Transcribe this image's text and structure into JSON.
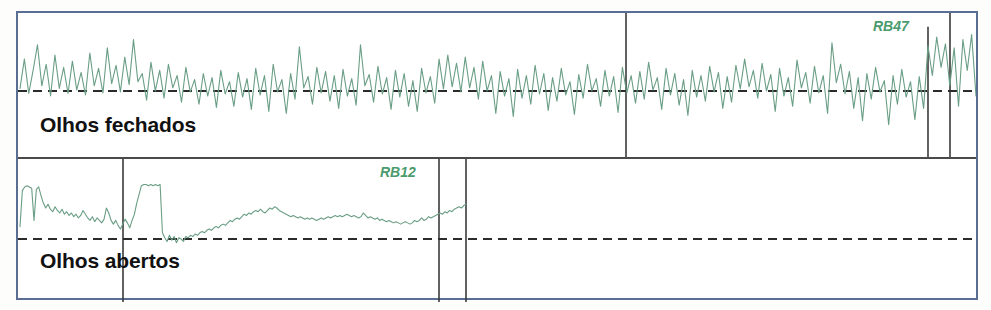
{
  "figure": {
    "kind": "eeg-recording-panels",
    "background_color": "#ffffff",
    "frame_color": "#5a6e94",
    "divider_color": "#4a4a4a",
    "baseline_color": "#2b2b2b",
    "trace_color": "#6a9e85",
    "tag_color": "#4b9b6e",
    "label_color": "#111111"
  },
  "panels": [
    {
      "id": "closed",
      "label": "Olhos fechados",
      "tag": "RB47",
      "baseline_label": "",
      "markers": [
        608,
        910,
        932
      ]
    },
    {
      "id": "open",
      "label": "Olhos abertos",
      "tag": "RB12",
      "baseline_label": "",
      "markers": [
        105,
        421,
        448
      ]
    }
  ],
  "chart_data": [
    {
      "type": "line",
      "id": "closed",
      "title": "Olhos fechados",
      "series_name": "RB47",
      "xlabel": "",
      "ylabel": "",
      "grid": false,
      "legend": "inline-tag-top-right",
      "baseline": 0,
      "xlim": [
        0,
        958
      ],
      "ylim": [
        -1.15,
        1.15
      ],
      "annotations": [
        "RB47"
      ],
      "vertical_markers": [
        608,
        910,
        932
      ],
      "values": [
        0.05,
        0.62,
        -0.05,
        0.4,
        0.9,
        0.1,
        0.52,
        -0.1,
        0.7,
        0.05,
        0.46,
        -0.05,
        0.58,
        0.02,
        0.36,
        -0.08,
        0.74,
        0.1,
        0.44,
        -0.04,
        0.84,
        0.14,
        0.5,
        -0.02,
        0.66,
        0.12,
        1.0,
        0.18,
        0.34,
        -0.18,
        0.56,
        0.0,
        0.4,
        -0.14,
        0.52,
        0.06,
        0.3,
        -0.22,
        0.46,
        -0.02,
        0.22,
        -0.26,
        0.34,
        -0.1,
        0.26,
        -0.32,
        0.4,
        -0.06,
        0.18,
        -0.3,
        0.36,
        -0.12,
        0.24,
        -0.36,
        0.44,
        -0.08,
        0.3,
        -0.4,
        0.52,
        -0.02,
        0.22,
        -0.44,
        0.34,
        -0.16,
        0.86,
        0.06,
        0.28,
        -0.26,
        0.46,
        -0.04,
        0.38,
        -0.2,
        0.3,
        -0.34,
        0.42,
        -0.1,
        0.24,
        -0.28,
        0.9,
        0.1,
        0.32,
        -0.22,
        0.48,
        -0.06,
        0.26,
        -0.36,
        0.4,
        -0.12,
        0.34,
        -0.3,
        0.2,
        -0.4,
        0.44,
        -0.04,
        0.28,
        -0.24,
        0.62,
        0.04,
        0.7,
        0.08,
        0.54,
        -0.02,
        0.66,
        0.06,
        0.46,
        -0.16,
        0.58,
        0.0,
        0.3,
        -0.44,
        0.38,
        -0.1,
        0.24,
        -0.5,
        0.42,
        -0.14,
        0.3,
        -0.26,
        0.5,
        -0.06,
        0.34,
        -0.38,
        0.26,
        -0.2,
        0.44,
        -0.08,
        0.18,
        -0.46,
        0.32,
        -0.14,
        0.52,
        0.0,
        0.24,
        -0.3,
        0.4,
        -0.1,
        0.28,
        -0.42,
        0.46,
        -0.04,
        0.3,
        -0.24,
        0.38,
        -0.16,
        0.56,
        0.02,
        0.26,
        -0.36,
        0.44,
        -0.08,
        0.34,
        -0.28,
        0.22,
        -0.48,
        0.4,
        -0.12,
        0.3,
        -0.2,
        0.48,
        -0.02,
        0.36,
        -0.34,
        0.28,
        -0.22,
        0.5,
        0.04,
        0.62,
        0.08,
        0.4,
        -0.14,
        0.54,
        0.0,
        0.32,
        -0.4,
        0.44,
        -0.1,
        0.26,
        -0.3,
        0.6,
        0.06,
        0.36,
        -0.24,
        0.48,
        -0.04,
        0.3,
        -0.44,
        0.94,
        0.16,
        0.52,
        -0.06,
        0.38,
        -0.34,
        0.26,
        -0.58,
        0.34,
        -0.16,
        0.46,
        -0.02,
        0.2,
        -0.66,
        0.3,
        -0.26,
        0.42,
        -0.12,
        0.18,
        -0.56,
        0.28,
        -0.34,
        0.88,
        0.3,
        1.05,
        0.46,
        0.92,
        0.1,
        0.84,
        -0.3,
        1.0,
        0.4,
        1.1,
        -0.1
      ]
    },
    {
      "type": "line",
      "id": "open",
      "title": "Olhos abertos",
      "series_name": "RB12",
      "xlabel": "",
      "ylabel": "",
      "grid": false,
      "legend": "inline-tag-top-right",
      "baseline": 0,
      "xlim": [
        0,
        958
      ],
      "ylim": [
        -0.35,
        1.15
      ],
      "annotations": [
        "RB12"
      ],
      "vertical_markers": [
        105,
        421,
        448
      ],
      "data_extent_x": [
        2,
        448
      ],
      "values": [
        0.2,
        0.78,
        0.84,
        0.86,
        0.84,
        0.82,
        0.3,
        0.8,
        0.84,
        0.7,
        0.58,
        0.5,
        0.56,
        0.48,
        0.44,
        0.52,
        0.46,
        0.42,
        0.48,
        0.4,
        0.44,
        0.38,
        0.42,
        0.36,
        0.4,
        0.34,
        0.38,
        0.46,
        0.4,
        0.34,
        0.3,
        0.36,
        0.28,
        0.34,
        0.3,
        0.26,
        0.32,
        0.5,
        0.42,
        0.3,
        0.24,
        0.3,
        0.22,
        0.16,
        0.24,
        0.32,
        0.26,
        0.18,
        0.3,
        0.4,
        0.58,
        0.72,
        0.86,
        0.88,
        0.88,
        0.86,
        0.88,
        0.86,
        0.88,
        0.86,
        0.88,
        0.1,
        0.02,
        -0.04,
        0.06,
        -0.02,
        0.04,
        -0.06,
        0.02,
        0.0,
        -0.04,
        0.04,
        0.02,
        0.06,
        0.04,
        0.08,
        0.06,
        0.1,
        0.12,
        0.1,
        0.14,
        0.16,
        0.14,
        0.18,
        0.2,
        0.18,
        0.22,
        0.24,
        0.22,
        0.26,
        0.3,
        0.28,
        0.32,
        0.34,
        0.32,
        0.36,
        0.4,
        0.38,
        0.42,
        0.4,
        0.44,
        0.46,
        0.44,
        0.48,
        0.44,
        0.42,
        0.46,
        0.5,
        0.48,
        0.52,
        0.5,
        0.46,
        0.44,
        0.42,
        0.4,
        0.38,
        0.36,
        0.38,
        0.36,
        0.34,
        0.36,
        0.34,
        0.32,
        0.34,
        0.32,
        0.34,
        0.32,
        0.3,
        0.32,
        0.34,
        0.32,
        0.34,
        0.36,
        0.34,
        0.36,
        0.38,
        0.36,
        0.38,
        0.36,
        0.38,
        0.4,
        0.38,
        0.36,
        0.38,
        0.36,
        0.34,
        0.36,
        0.42,
        0.38,
        0.34,
        0.36,
        0.34,
        0.32,
        0.34,
        0.3,
        0.32,
        0.3,
        0.28,
        0.3,
        0.28,
        0.26,
        0.28,
        0.26,
        0.24,
        0.26,
        0.28,
        0.26,
        0.24,
        0.26,
        0.3,
        0.28,
        0.3,
        0.34,
        0.3,
        0.32,
        0.36,
        0.34,
        0.36,
        0.38,
        0.4,
        0.42,
        0.4,
        0.44,
        0.42,
        0.46,
        0.44,
        0.48,
        0.5,
        0.52,
        0.5,
        0.54,
        0.56
      ]
    }
  ]
}
